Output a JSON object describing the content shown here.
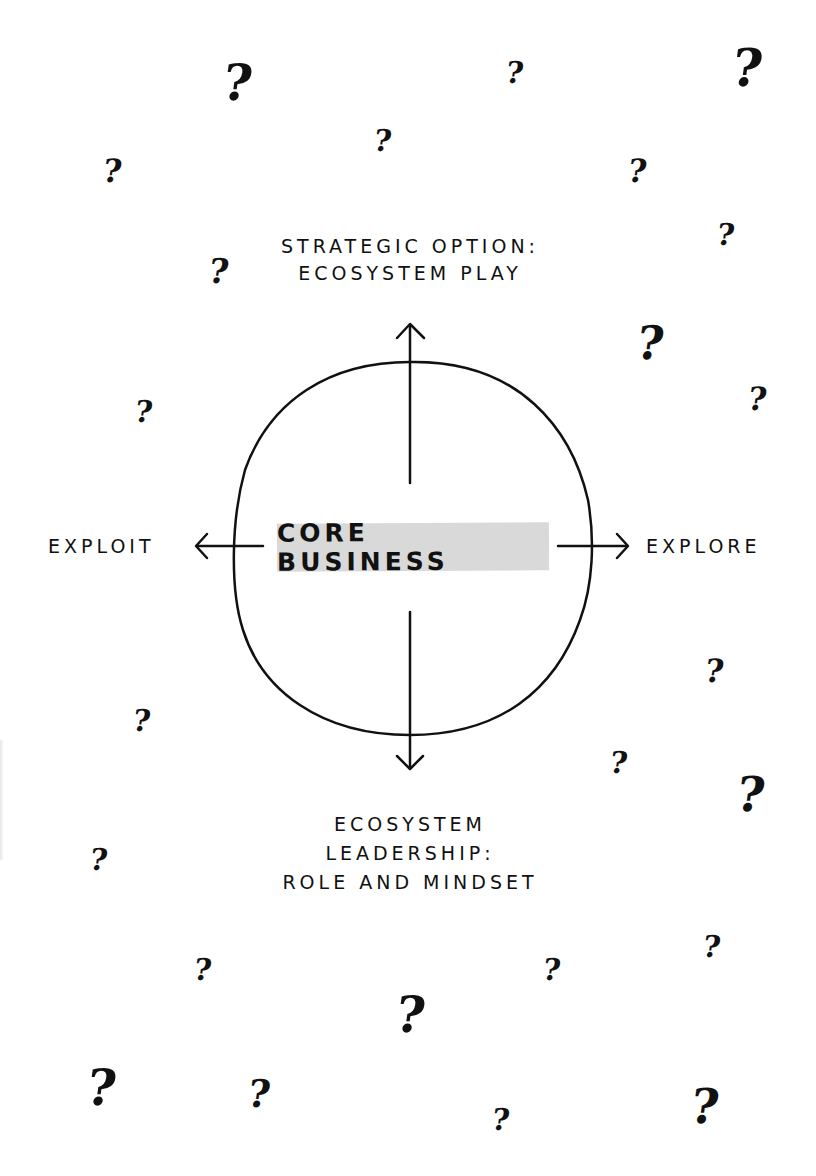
{
  "diagram": {
    "center": {
      "label": "CORE BUSINESS",
      "highlight_color": "#d9d9d9"
    },
    "top": {
      "lines": [
        "STRATEGIC OPTION:",
        "ECOSYSTEM PLAY"
      ]
    },
    "bottom": {
      "lines": [
        "ECOSYSTEM",
        "LEADERSHIP:",
        "ROLE AND MINDSET"
      ]
    },
    "left": {
      "label": "EXPLOIT"
    },
    "right": {
      "label": "EXPLORE"
    },
    "stroke_color": "#111111",
    "background_color": "#ffffff"
  },
  "question_marks": {
    "glyph": "?",
    "items": [
      {
        "x": 223,
        "y": 58,
        "size": 50
      },
      {
        "x": 506,
        "y": 58,
        "size": 30
      },
      {
        "x": 732,
        "y": 42,
        "size": 52
      },
      {
        "x": 374,
        "y": 126,
        "size": 30
      },
      {
        "x": 103,
        "y": 155,
        "size": 32
      },
      {
        "x": 628,
        "y": 155,
        "size": 32
      },
      {
        "x": 717,
        "y": 220,
        "size": 30
      },
      {
        "x": 209,
        "y": 254,
        "size": 34
      },
      {
        "x": 637,
        "y": 320,
        "size": 46
      },
      {
        "x": 748,
        "y": 383,
        "size": 32
      },
      {
        "x": 135,
        "y": 397,
        "size": 30
      },
      {
        "x": 705,
        "y": 655,
        "size": 32
      },
      {
        "x": 133,
        "y": 706,
        "size": 30
      },
      {
        "x": 610,
        "y": 748,
        "size": 30
      },
      {
        "x": 737,
        "y": 770,
        "size": 48
      },
      {
        "x": 90,
        "y": 845,
        "size": 30
      },
      {
        "x": 194,
        "y": 955,
        "size": 30
      },
      {
        "x": 543,
        "y": 955,
        "size": 30
      },
      {
        "x": 703,
        "y": 932,
        "size": 30
      },
      {
        "x": 396,
        "y": 990,
        "size": 50
      },
      {
        "x": 87,
        "y": 1063,
        "size": 50
      },
      {
        "x": 248,
        "y": 1075,
        "size": 38
      },
      {
        "x": 492,
        "y": 1105,
        "size": 30
      },
      {
        "x": 691,
        "y": 1082,
        "size": 48
      }
    ]
  }
}
